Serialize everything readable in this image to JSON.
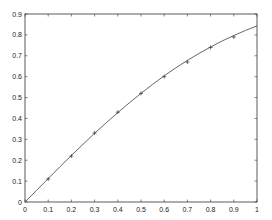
{
  "chart_data": {
    "type": "line",
    "title": "",
    "xlabel": "",
    "ylabel": "",
    "xlim": [
      0,
      1
    ],
    "ylim": [
      0,
      0.9
    ],
    "grid": false,
    "legend": null,
    "x_ticks": [
      "0",
      "0.1",
      "0.2",
      "0.3",
      "0.4",
      "0.5",
      "0.6",
      "0.7",
      "0.8",
      "0.9",
      "1"
    ],
    "y_ticks": [
      "0",
      "0.1",
      "0.2",
      "0.3",
      "0.4",
      "0.5",
      "0.6",
      "0.7",
      "0.8",
      "0.9"
    ],
    "series": [
      {
        "name": "curve",
        "style": "solid line",
        "x": [
          0,
          0.05,
          0.1,
          0.15,
          0.2,
          0.25,
          0.3,
          0.35,
          0.4,
          0.45,
          0.5,
          0.55,
          0.6,
          0.65,
          0.7,
          0.75,
          0.8,
          0.85,
          0.9,
          0.95,
          1.0
        ],
        "values": [
          0,
          0.056,
          0.112,
          0.168,
          0.223,
          0.276,
          0.329,
          0.379,
          0.428,
          0.475,
          0.52,
          0.563,
          0.604,
          0.642,
          0.678,
          0.711,
          0.742,
          0.771,
          0.797,
          0.821,
          0.843
        ]
      },
      {
        "name": "samples",
        "style": "plus markers",
        "x": [
          0.1,
          0.2,
          0.3,
          0.4,
          0.5,
          0.6,
          0.7,
          0.8,
          0.9
        ],
        "values": [
          0.11,
          0.22,
          0.33,
          0.43,
          0.52,
          0.6,
          0.67,
          0.74,
          0.79
        ]
      }
    ]
  },
  "colors": {
    "axis": "#333333",
    "line": "#555555",
    "marker": "#333333",
    "background": "#ffffff"
  }
}
